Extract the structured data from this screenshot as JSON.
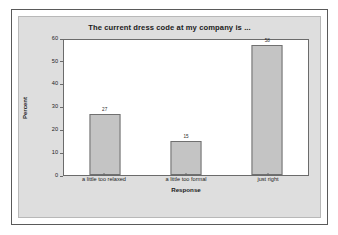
{
  "chart_data": {
    "type": "bar",
    "title": "The current dress code at my company is ...",
    "xlabel": "Response",
    "ylabel": "Percent",
    "categories": [
      "a little too relaxed",
      "a little too formal",
      "just right"
    ],
    "values": [
      27,
      15,
      58
    ],
    "value_labels": [
      "27",
      "15",
      "58"
    ],
    "ylim": [
      0,
      60
    ],
    "yticks": [
      0,
      10,
      20,
      30,
      40,
      50,
      60
    ],
    "ytick_labels": [
      "0",
      "10",
      "20",
      "30",
      "40",
      "50",
      "60"
    ],
    "grid": false,
    "legend": "none",
    "colors": {
      "bar_fill": "#c4c4c4",
      "bar_border": "#707070",
      "panel_background": "#dedede",
      "plot_background": "#ffffff",
      "axis": "#6b6b6b",
      "text": "#1b1b1b"
    }
  }
}
